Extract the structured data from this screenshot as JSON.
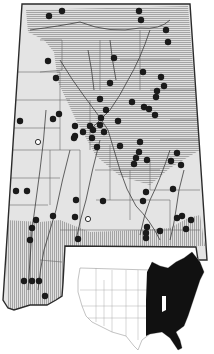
{
  "map": {
    "width": 214,
    "height": 354,
    "colors": {
      "background": "#ffffff",
      "state_fill": "#e4e4e4",
      "outline": "#2b2b2b",
      "county_line": "#6a6a6a",
      "river": "#3c3c3c",
      "hatch": "#8a8a8a",
      "record_dot": "#1a1a1a",
      "range_fill": "#111111",
      "us_outline": "#9a9a9a"
    },
    "state_outline": "M22,4 L190,4 L207,260 L198,260 L196,247 L65,246 L63,283 L62,296 L56,300 L47,305 L30,305 L14,310 L8,308 L3,300 Z",
    "north_hatch_region": "M26,10 L188,6 L200,150 L170,168 L150,185 L120,176 L96,156 L76,120 L58,82 L54,52 L44,40 L28,32 Z",
    "south_hatch_region": "M5,220 L40,222 L60,220 L90,232 L140,230 L170,228 L188,218 L200,215 L205,246 L65,246 L63,283 L62,296 L56,300 L47,305 L30,305 L14,310 L8,308 Z",
    "county_lines": [
      "M40,40 L62,40 L62,70 L40,72",
      "M18,72 L60,72 L60,100",
      "M14,100 L70,100",
      "M12,128 L60,128 L60,150",
      "M10,150 L80,150 L80,175",
      "M8,178 L60,178",
      "M6,205 L48,205",
      "M50,150 L50,205",
      "M90,100 L90,150",
      "M110,145 L110,200",
      "M130,170 L130,220",
      "M150,160 L150,190",
      "M150,190 L200,190",
      "M170,120 L204,120",
      "M160,140 L200,140",
      "M95,170 L160,170",
      "M80,175 L80,230",
      "M60,230 L200,230",
      "M130,200 L170,200",
      "M170,200 L170,230",
      "M120,60 L180,60",
      "M100,40 L100,90",
      "M140,30 L140,90",
      "M150,90 L196,90",
      "M60,100 L60,128",
      "M96,200 L130,200",
      "M30,232 L30,290",
      "M40,260 L62,262"
    ],
    "rivers": [
      "M30,30 Q60,26 80,22 Q110,34 140,28 Q160,30 170,20",
      "M60,60 Q72,80 84,96 Q98,114 108,130 Q114,150 120,170 Q126,190 136,206 Q150,220 160,240",
      "M150,30 Q140,60 128,80 Q120,96 110,110 Q100,120 90,130",
      "M46,110 Q44,140 40,170 Q36,200 32,230 Q30,260 28,290",
      "M70,150 Q62,180 56,210 Q50,230 44,250 Q40,270 38,290",
      "M100,140 Q92,170 86,200 Q80,220 76,240",
      "M170,150 Q160,180 150,200 Q144,215 140,235",
      "M184,170 Q178,190 176,210 Q174,225 170,240",
      "M88,50 Q92,70 94,90",
      "M110,40 Q112,60 116,80"
    ],
    "records": [
      {
        "x": 49,
        "y": 16
      },
      {
        "x": 62,
        "y": 11
      },
      {
        "x": 139,
        "y": 11
      },
      {
        "x": 141,
        "y": 20
      },
      {
        "x": 166,
        "y": 30
      },
      {
        "x": 168,
        "y": 42
      },
      {
        "x": 48,
        "y": 61
      },
      {
        "x": 56,
        "y": 78
      },
      {
        "x": 114,
        "y": 58
      },
      {
        "x": 143,
        "y": 72
      },
      {
        "x": 110,
        "y": 83
      },
      {
        "x": 161,
        "y": 77
      },
      {
        "x": 164,
        "y": 86
      },
      {
        "x": 157,
        "y": 91
      },
      {
        "x": 156,
        "y": 97
      },
      {
        "x": 20,
        "y": 121
      },
      {
        "x": 53,
        "y": 119
      },
      {
        "x": 59,
        "y": 114
      },
      {
        "x": 75,
        "y": 126
      },
      {
        "x": 132,
        "y": 102
      },
      {
        "x": 144,
        "y": 107
      },
      {
        "x": 149,
        "y": 109
      },
      {
        "x": 155,
        "y": 115
      },
      {
        "x": 100,
        "y": 99
      },
      {
        "x": 106,
        "y": 110
      },
      {
        "x": 101,
        "y": 118
      },
      {
        "x": 118,
        "y": 121
      },
      {
        "x": 75,
        "y": 136
      },
      {
        "x": 83,
        "y": 132
      },
      {
        "x": 90,
        "y": 126
      },
      {
        "x": 93,
        "y": 130
      },
      {
        "x": 100,
        "y": 125
      },
      {
        "x": 92,
        "y": 138
      },
      {
        "x": 97,
        "y": 147
      },
      {
        "x": 74,
        "y": 138
      },
      {
        "x": 104,
        "y": 132
      },
      {
        "x": 120,
        "y": 146
      },
      {
        "x": 140,
        "y": 142
      },
      {
        "x": 136,
        "y": 158
      },
      {
        "x": 139,
        "y": 152
      },
      {
        "x": 134,
        "y": 164
      },
      {
        "x": 147,
        "y": 160
      },
      {
        "x": 177,
        "y": 153
      },
      {
        "x": 171,
        "y": 161
      },
      {
        "x": 181,
        "y": 165
      },
      {
        "x": 16,
        "y": 191
      },
      {
        "x": 27,
        "y": 191
      },
      {
        "x": 53,
        "y": 216
      },
      {
        "x": 36,
        "y": 220
      },
      {
        "x": 32,
        "y": 228
      },
      {
        "x": 30,
        "y": 240
      },
      {
        "x": 76,
        "y": 200
      },
      {
        "x": 75,
        "y": 217
      },
      {
        "x": 103,
        "y": 201
      },
      {
        "x": 146,
        "y": 192
      },
      {
        "x": 143,
        "y": 201
      },
      {
        "x": 173,
        "y": 189
      },
      {
        "x": 177,
        "y": 218
      },
      {
        "x": 182,
        "y": 216
      },
      {
        "x": 191,
        "y": 220
      },
      {
        "x": 186,
        "y": 229
      },
      {
        "x": 147,
        "y": 227
      },
      {
        "x": 146,
        "y": 233
      },
      {
        "x": 146,
        "y": 238
      },
      {
        "x": 160,
        "y": 231
      },
      {
        "x": 78,
        "y": 239
      },
      {
        "x": 24,
        "y": 281
      },
      {
        "x": 32,
        "y": 281
      },
      {
        "x": 39,
        "y": 281
      },
      {
        "x": 45,
        "y": 296
      }
    ],
    "open_records": [
      {
        "x": 38,
        "y": 142
      },
      {
        "x": 88,
        "y": 219
      }
    ],
    "record_radius": 3.2,
    "inset": {
      "us_outline": "M80,268 L150,270 L152,262 L160,266 L168,268 L176,262 L184,258 L192,252 L200,262 L204,272 L200,280 L196,292 L192,304 L188,316 L184,326 L176,332 L180,340 L182,348 L178,350 L170,338 L162,332 L150,334 L142,340 L138,350 L134,346 L126,336 L112,332 L100,326 L92,322 L86,316 L82,306 L78,292 L78,280 Z",
      "range_fill": "M147,272 L152,262 L160,266 L168,268 L176,262 L184,258 L192,252 L200,262 L204,272 L200,280 L196,292 L192,304 L188,316 L184,326 L176,332 L180,340 L182,348 L178,350 L170,338 L162,332 L150,334 L146,336 L146,300 Z",
      "lake_cutout": "M162,296 L166,296 L166,310 L162,312 Z",
      "state_lines": [
        "M96,268 L96,322",
        "M112,270 L112,332",
        "M126,270 L126,336",
        "M138,270 L138,340",
        "M80,290 L147,290",
        "M82,306 L147,306",
        "M88,318 L147,318",
        "M104,280 L104,326"
      ]
    }
  }
}
